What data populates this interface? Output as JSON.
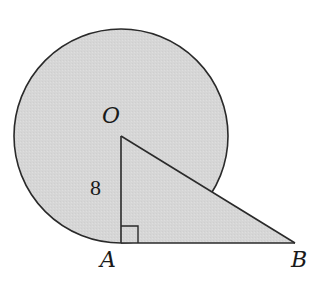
{
  "diagram": {
    "type": "geometry",
    "shapes": {
      "circle": {
        "center_label": "O",
        "cx": 121,
        "cy": 135,
        "r": 107,
        "fill": "#d9d9d9",
        "stroke": "#2a2a2a"
      },
      "triangle": {
        "vertices": [
          "O",
          "A",
          "B"
        ],
        "right_angle_at": "A",
        "fill": "#d9d9d9",
        "stroke": "#2a2a2a"
      }
    },
    "points": {
      "O": {
        "label": "O",
        "x": 121,
        "y": 136
      },
      "A": {
        "label": "A",
        "x": 121,
        "y": 243
      },
      "B": {
        "label": "B",
        "x": 295,
        "y": 243
      }
    },
    "segment_labels": {
      "OA": "8"
    },
    "colors": {
      "fill": "#d9d9d9",
      "stroke": "#2a2a2a",
      "background": "#ffffff"
    }
  }
}
